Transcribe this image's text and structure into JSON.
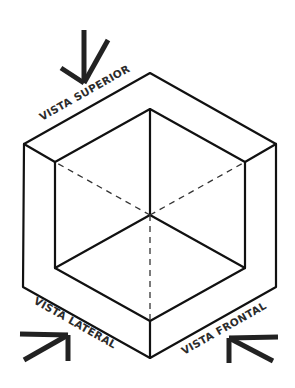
{
  "diagram": {
    "type": "isometric-cube-views",
    "colors": {
      "background": "#ffffff",
      "line": "#111111",
      "text": "#2b2b2b"
    },
    "labels": {
      "top": "VISTA SUPERIOR",
      "left": "VISTA LATERAL",
      "front": "VISTA FRONTAL"
    },
    "arrows": [
      {
        "name": "top-view-arrow",
        "direction": "down"
      },
      {
        "name": "left-view-arrow",
        "direction": "up-right"
      },
      {
        "name": "front-view-arrow",
        "direction": "up-left"
      }
    ],
    "edges": {
      "solid": "visible edges",
      "dashed": "hidden edges"
    }
  }
}
